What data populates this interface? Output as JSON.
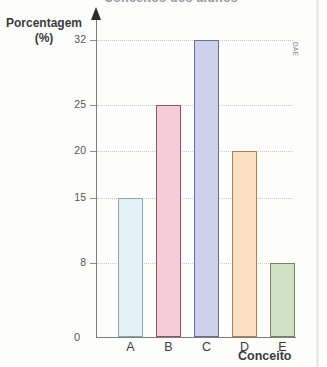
{
  "title_sliver": "Conceitos dos alunos",
  "credit": "DAE",
  "axes": {
    "ylabel_main": "Porcentagem",
    "ylabel_unit": "(%)",
    "xlabel": "Conceito",
    "zero": "0"
  },
  "chart_data": {
    "type": "bar",
    "title": "Conceitos dos alunos",
    "xlabel": "Conceito",
    "ylabel": "Porcentagem (%)",
    "categories": [
      "A",
      "B",
      "C",
      "D",
      "E"
    ],
    "values": [
      15,
      25,
      32,
      20,
      8
    ],
    "ytick_labels": [
      "0",
      "8",
      "15",
      "20",
      "25",
      "32"
    ],
    "ytick_values": [
      0,
      8,
      15,
      20,
      25,
      32
    ],
    "ylim": [
      0,
      32
    ],
    "grid": "horizontal-dotted",
    "legend": "none",
    "bar_colors": [
      "#e1f1f5",
      "#f6ccd7",
      "#cdd0ea",
      "#fbdfc2",
      "#cfe0c4"
    ],
    "bar_border_colors": [
      "#8ea7ad",
      "#8a5563",
      "#6a6d93",
      "#a98456",
      "#6d8a60"
    ]
  }
}
